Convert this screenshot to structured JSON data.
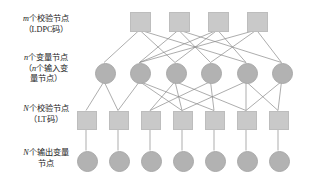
{
  "figure": {
    "width": 324,
    "height": 183,
    "background": "#ffffff"
  },
  "labels": [
    {
      "name": "label-ldpc-check-nodes",
      "line1_var": "m",
      "line1_rest": "个校验节点",
      "line2": "（LDPC码）",
      "x": 4,
      "y": 14
    },
    {
      "name": "label-variable-nodes",
      "line1_var": "n",
      "line1_rest": "个变量节点",
      "line2_var": "n",
      "line2_rest": "（",
      "line2_tail": "个输入变",
      "line3": "量节点）",
      "x": 4,
      "y": 53
    },
    {
      "name": "label-lt-check-nodes",
      "line1_var": "N",
      "line1_rest": "个校验节点",
      "line2": "（LT码）",
      "x": 4,
      "y": 104
    },
    {
      "name": "label-output-variable-nodes",
      "line1_var": "N",
      "line1_rest": "个输出变量",
      "line2": "节点",
      "x": 4,
      "y": 148
    }
  ],
  "colors": {
    "square_fill": "#c9c9c9",
    "square_stroke": "#bdbdbd",
    "circle_fill": "#b2b2b2",
    "circle_stroke": "#a8a8a8",
    "edge_stroke": "#8a8a8a",
    "text": "#1b1b1b"
  },
  "graph_data": {
    "type": "tanner-graph",
    "layers": [
      {
        "id": "ldpc_check",
        "shape": "square",
        "count": 4,
        "label_key": "m",
        "nodes": [
          {
            "id": "c0",
            "cx": 139.5,
            "cy": 21,
            "w": 19,
            "h": 18
          },
          {
            "id": "c1",
            "cx": 178.5,
            "cy": 21,
            "w": 19,
            "h": 18
          },
          {
            "id": "c2",
            "cx": 217.5,
            "cy": 21,
            "w": 19,
            "h": 18
          },
          {
            "id": "c3",
            "cx": 256.5,
            "cy": 21,
            "w": 19,
            "h": 18
          }
        ]
      },
      {
        "id": "variable",
        "shape": "circle",
        "count": 6,
        "label_key": "n",
        "nodes": [
          {
            "id": "v0",
            "cx": 104,
            "cy": 72,
            "r": 9.5
          },
          {
            "id": "v1",
            "cx": 139.5,
            "cy": 72,
            "r": 9.5
          },
          {
            "id": "v2",
            "cx": 175,
            "cy": 72,
            "r": 9.5
          },
          {
            "id": "v3",
            "cx": 210.5,
            "cy": 72,
            "r": 9.5
          },
          {
            "id": "v4",
            "cx": 246,
            "cy": 72,
            "r": 9.5
          },
          {
            "id": "v5",
            "cx": 281.5,
            "cy": 72,
            "r": 9.5
          }
        ]
      },
      {
        "id": "lt_check",
        "shape": "square",
        "count": 7,
        "label_key": "N",
        "nodes": [
          {
            "id": "l0",
            "cx": 86,
            "cy": 119,
            "w": 18,
            "h": 17
          },
          {
            "id": "l1",
            "cx": 118,
            "cy": 119,
            "w": 18,
            "h": 17
          },
          {
            "id": "l2",
            "cx": 150,
            "cy": 119,
            "w": 18,
            "h": 17
          },
          {
            "id": "l3",
            "cx": 182,
            "cy": 119,
            "w": 18,
            "h": 17
          },
          {
            "id": "l4",
            "cx": 214,
            "cy": 119,
            "w": 18,
            "h": 17
          },
          {
            "id": "l5",
            "cx": 246,
            "cy": 119,
            "w": 18,
            "h": 17
          },
          {
            "id": "l6",
            "cx": 278,
            "cy": 119,
            "w": 18,
            "h": 17
          }
        ]
      },
      {
        "id": "output_variable",
        "shape": "circle",
        "count": 7,
        "label_key": "N",
        "nodes": [
          {
            "id": "o0",
            "cx": 86,
            "cy": 160,
            "r": 9.5
          },
          {
            "id": "o1",
            "cx": 118,
            "cy": 160,
            "r": 9.5
          },
          {
            "id": "o2",
            "cx": 150,
            "cy": 160,
            "r": 9.5
          },
          {
            "id": "o3",
            "cx": 182,
            "cy": 160,
            "r": 9.5
          },
          {
            "id": "o4",
            "cx": 214,
            "cy": 160,
            "r": 9.5
          },
          {
            "id": "o5",
            "cx": 246,
            "cy": 160,
            "r": 9.5
          },
          {
            "id": "o6",
            "cx": 278,
            "cy": 160,
            "r": 9.5
          }
        ]
      }
    ],
    "edges_check_to_variable": [
      [
        "c0",
        "v0"
      ],
      [
        "c0",
        "v2"
      ],
      [
        "c0",
        "v4"
      ],
      [
        "c1",
        "v1"
      ],
      [
        "c1",
        "v3"
      ],
      [
        "c1",
        "v5"
      ],
      [
        "c2",
        "v1"
      ],
      [
        "c2",
        "v2"
      ],
      [
        "c2",
        "v4"
      ],
      [
        "c3",
        "v1"
      ],
      [
        "c3",
        "v3"
      ],
      [
        "c3",
        "v5"
      ]
    ],
    "edges_variable_to_lt": [
      [
        "v0",
        "l0"
      ],
      [
        "v0",
        "l1"
      ],
      [
        "v1",
        "l1"
      ],
      [
        "v1",
        "l3"
      ],
      [
        "v1",
        "l4"
      ],
      [
        "v2",
        "l2"
      ],
      [
        "v2",
        "l3"
      ],
      [
        "v2",
        "l5"
      ],
      [
        "v3",
        "l2"
      ],
      [
        "v3",
        "l4"
      ],
      [
        "v4",
        "l3"
      ],
      [
        "v4",
        "l5"
      ],
      [
        "v4",
        "l6"
      ],
      [
        "v5",
        "l5"
      ],
      [
        "v5",
        "l6"
      ]
    ],
    "edges_lt_to_output": [
      [
        "l0",
        "o0"
      ],
      [
        "l1",
        "o1"
      ],
      [
        "l2",
        "o2"
      ],
      [
        "l3",
        "o3"
      ],
      [
        "l4",
        "o4"
      ],
      [
        "l5",
        "o5"
      ],
      [
        "l6",
        "o6"
      ]
    ]
  }
}
